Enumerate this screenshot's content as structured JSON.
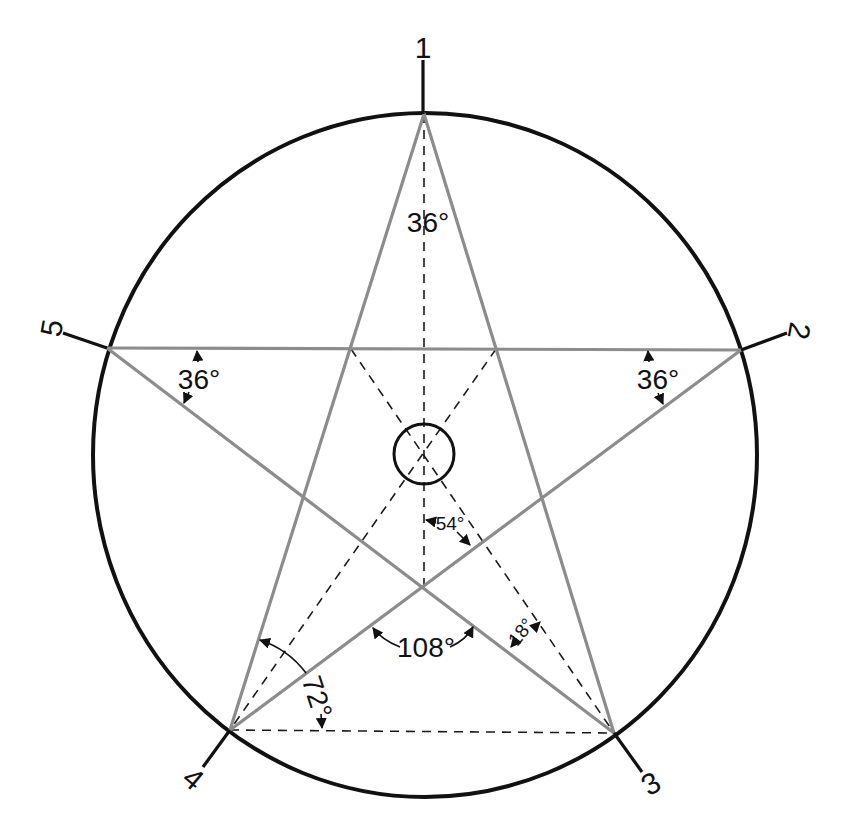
{
  "figure": {
    "vertices": [
      {
        "id": "1",
        "label": "1"
      },
      {
        "id": "2",
        "label": "2"
      },
      {
        "id": "3",
        "label": "3"
      },
      {
        "id": "4",
        "label": "4"
      },
      {
        "id": "5",
        "label": "5"
      }
    ],
    "angles": {
      "top_vertex": "36°",
      "left_vertex": "36°",
      "right_vertex": "36°",
      "center_offset": "54°",
      "inner_bottom": "108°",
      "right_small": "18°",
      "base_left": "72°"
    },
    "colors": {
      "circle": "#111111",
      "star_lines": "#8c8c8c",
      "construction_lines": "#1a1a1a",
      "background": "#ffffff"
    }
  }
}
